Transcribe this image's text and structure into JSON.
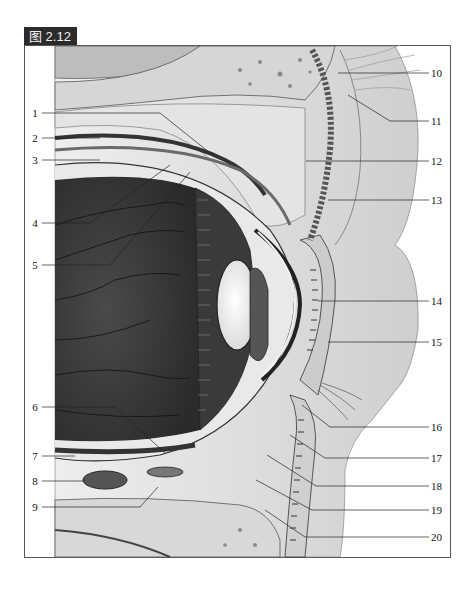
{
  "figure": {
    "badge": "图 2.12",
    "badge_color": "#2b2b2b"
  },
  "labels": {
    "left": [
      {
        "n": "1",
        "y": 113
      },
      {
        "n": "2",
        "y": 138
      },
      {
        "n": "3",
        "y": 160
      },
      {
        "n": "4",
        "y": 223
      },
      {
        "n": "5",
        "y": 265
      },
      {
        "n": "6",
        "y": 407
      },
      {
        "n": "7",
        "y": 456
      },
      {
        "n": "8",
        "y": 481
      },
      {
        "n": "9",
        "y": 507
      }
    ],
    "right": [
      {
        "n": "10",
        "y": 73
      },
      {
        "n": "11",
        "y": 121
      },
      {
        "n": "12",
        "y": 161
      },
      {
        "n": "13",
        "y": 200
      },
      {
        "n": "14",
        "y": 301
      },
      {
        "n": "15",
        "y": 342
      },
      {
        "n": "16",
        "y": 427
      },
      {
        "n": "17",
        "y": 458
      },
      {
        "n": "18",
        "y": 486
      },
      {
        "n": "19",
        "y": 510
      },
      {
        "n": "20",
        "y": 537
      }
    ]
  }
}
